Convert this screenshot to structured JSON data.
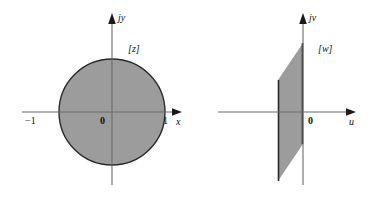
{
  "figure": {
    "background_color": "#ffffff",
    "region_fill_color": "#9c9c9c",
    "region_edge_color": "#2a2a2a",
    "axis_color": "#6b6b6b"
  },
  "panels": [
    {
      "id": "z-plane",
      "plane_label": "[z]",
      "vertical_axis_label": "jy",
      "horizontal_axis_label": "x",
      "origin_label": "0",
      "tick_left_label": "−1",
      "tick_right_label": "1",
      "region_type": "filled-disk",
      "region_description": "unit disk centered at origin"
    },
    {
      "id": "w-plane",
      "plane_label": "[w]",
      "vertical_axis_label": "jv",
      "horizontal_axis_label": "u",
      "origin_label": "0",
      "region_type": "filled-parallelogram",
      "region_description": "slanted vertical strip to the left of the jv axis"
    }
  ]
}
